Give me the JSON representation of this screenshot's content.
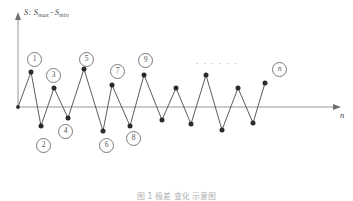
{
  "figure": {
    "y_axis_label_prefix": "S:",
    "y_axis_label_main": "S",
    "y_axis_sub_max": "max",
    "y_axis_minus": "−",
    "y_axis_label_main2": "S",
    "y_axis_sub_min": "min",
    "x_axis_label": "n",
    "ellipsis": "· · · · · ·",
    "caption": "图 1  极差 变化 示意图",
    "axis_color": "#8a8a8a",
    "line_color": "#4a4a4a",
    "point_color": "#2b2b2b",
    "label_color": "#555555"
  },
  "labels": [
    {
      "text": "1",
      "kind": "numeric",
      "x": 27,
      "y": 52
    },
    {
      "text": "2",
      "kind": "numeric",
      "x": 36,
      "y": 138
    },
    {
      "text": "3",
      "kind": "numeric",
      "x": 46,
      "y": 68
    },
    {
      "text": "4",
      "kind": "numeric",
      "x": 58,
      "y": 124
    },
    {
      "text": "5",
      "kind": "numeric",
      "x": 79,
      "y": 52
    },
    {
      "text": "6",
      "kind": "numeric",
      "x": 99,
      "y": 138
    },
    {
      "text": "7",
      "kind": "numeric",
      "x": 110,
      "y": 64
    },
    {
      "text": "8",
      "kind": "numeric",
      "x": 126,
      "y": 131
    },
    {
      "text": "9",
      "kind": "numeric",
      "x": 138,
      "y": 53
    },
    {
      "text": "n",
      "kind": "italic",
      "x": 272,
      "y": 62
    }
  ],
  "chart_data": {
    "type": "line",
    "title": "",
    "subtitle": "",
    "xlabel": "n",
    "ylabel": "S: Smax−Smin",
    "grid": false,
    "legend": "none",
    "axis_origin": {
      "x": 18,
      "y": 107
    },
    "x_axis_end": {
      "x": 341,
      "y": 107
    },
    "y_axis_top": {
      "x": 18,
      "y": 13
    },
    "xlim": [
      0,
      28
    ],
    "ylim": [
      -40,
      60
    ],
    "series": [
      {
        "name": "range-sequence",
        "points": [
          {
            "i": 0,
            "px": 18,
            "py": 107,
            "label": ""
          },
          {
            "i": 1,
            "px": 31,
            "py": 72,
            "label": "1"
          },
          {
            "i": 2,
            "px": 41,
            "py": 126,
            "label": "2"
          },
          {
            "i": 3,
            "px": 54,
            "py": 88,
            "label": "3"
          },
          {
            "i": 4,
            "px": 68,
            "py": 118,
            "label": "4"
          },
          {
            "i": 5,
            "px": 84,
            "py": 69,
            "label": "5"
          },
          {
            "i": 6,
            "px": 103,
            "py": 131,
            "label": "6"
          },
          {
            "i": 7,
            "px": 112,
            "py": 85,
            "label": "7"
          },
          {
            "i": 8,
            "px": 130,
            "py": 126,
            "label": "8"
          },
          {
            "i": 9,
            "px": 144,
            "py": 75,
            "label": "9"
          },
          {
            "i": 10,
            "px": 162,
            "py": 120,
            "label": ""
          },
          {
            "i": 11,
            "px": 176,
            "py": 88,
            "label": ""
          },
          {
            "i": 12,
            "px": 191,
            "py": 124,
            "label": ""
          },
          {
            "i": 13,
            "px": 206,
            "py": 75,
            "label": ""
          },
          {
            "i": 14,
            "px": 222,
            "py": 130,
            "label": ""
          },
          {
            "i": 15,
            "px": 238,
            "py": 88,
            "label": ""
          },
          {
            "i": 16,
            "px": 253,
            "py": 123,
            "label": ""
          },
          {
            "i": 17,
            "px": 265,
            "py": 83,
            "label": "n"
          }
        ]
      }
    ]
  }
}
